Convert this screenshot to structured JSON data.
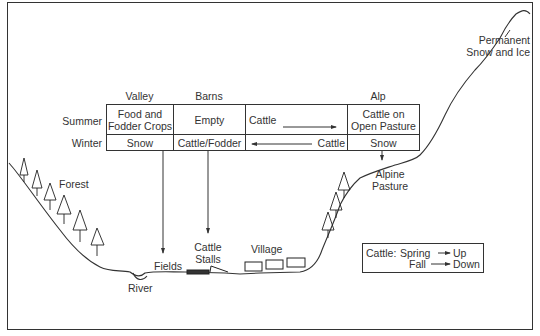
{
  "diagram": {
    "columns": [
      "Valley",
      "Barns",
      "Alp"
    ],
    "rows": [
      {
        "season": "Summer",
        "valley": "Food and Fodder Crops",
        "valley_line1": "Food and",
        "valley_line2": "Fodder Crops",
        "barns": "Empty",
        "movement": "Cattle",
        "movement_direction": "right",
        "alp": "Cattle on Open Pasture",
        "alp_line1": "Cattle on",
        "alp_line2": "Open Pasture"
      },
      {
        "season": "Winter",
        "valley": "Snow",
        "barns": "Cattle/Fodder",
        "movement": "Cattle",
        "movement_direction": "left",
        "alp": "Snow"
      }
    ],
    "landscape_labels": {
      "permanent_line1": "Permanent",
      "permanent_line2": "Snow and Ice",
      "forest": "Forest",
      "alpine_line1": "Alpine",
      "alpine_line2": "Pasture",
      "fields": "Fields",
      "river": "River",
      "stalls_line1": "Cattle",
      "stalls_line2": "Stalls",
      "village": "Village"
    },
    "legend": {
      "prefix": "Cattle:",
      "items": [
        {
          "season": "Spring",
          "direction": "Up"
        },
        {
          "season": "Fall",
          "direction": "Down"
        }
      ]
    },
    "colors": {
      "line": "#333333",
      "background": "#ffffff"
    }
  }
}
